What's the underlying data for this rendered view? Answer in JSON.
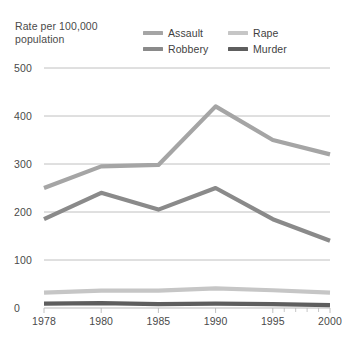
{
  "chart_data": {
    "type": "line",
    "title": "Rate per 100,000 population",
    "xlabel": "",
    "ylabel": "Rate per 100,000 population",
    "x": [
      "1978",
      "1980",
      "1985",
      "1990",
      "1995",
      "2000"
    ],
    "categories": [
      "1978",
      "1980",
      "1985",
      "1990",
      "1995",
      "2000"
    ],
    "yticks": [
      "0",
      "100",
      "200",
      "300",
      "400",
      "500"
    ],
    "ylim": [
      0,
      500
    ],
    "grid": true,
    "legend_position": "top-right",
    "series": [
      {
        "name": "Assault",
        "color": "#a5a5a5",
        "values": [
          250,
          295,
          298,
          420,
          350,
          320
        ]
      },
      {
        "name": "Rape",
        "color": "#c6c6c6",
        "values": [
          32,
          36,
          36,
          41,
          37,
          32
        ]
      },
      {
        "name": "Robbery",
        "color": "#8a8a8a",
        "values": [
          185,
          240,
          205,
          250,
          185,
          140
        ]
      },
      {
        "name": "Murder",
        "color": "#5e5e5e",
        "values": [
          9,
          10,
          8,
          9,
          8,
          6
        ]
      }
    ]
  },
  "title_lines": {
    "line1": "Rate per 100,000",
    "line2": "population"
  },
  "legend": {
    "items": [
      {
        "label": "Assault",
        "swatch": "legend-swatch-assault"
      },
      {
        "label": "Rape",
        "swatch": "legend-swatch-rape"
      },
      {
        "label": "Robbery",
        "swatch": "legend-swatch-robbery"
      },
      {
        "label": "Murder",
        "swatch": "legend-swatch-murder"
      }
    ]
  },
  "colors": {
    "assault": "#a5a5a5",
    "rape": "#c6c6c6",
    "robbery": "#8a8a8a",
    "murder": "#5e5e5e",
    "gridline": "#b9b9b9",
    "text": "#4a4a4a",
    "background": "#ffffff"
  }
}
